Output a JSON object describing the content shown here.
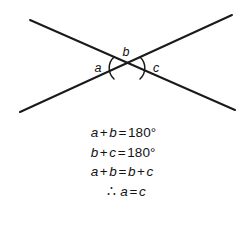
{
  "figure": {
    "line_color": "#1a1a1a",
    "background_color": "#ffffff",
    "labels": {
      "left_angle": "a",
      "top_angle": "b",
      "right_angle": "c"
    },
    "lines": [
      {
        "name": "line-down-right",
        "x1": 30,
        "y1": 20,
        "x2": 235,
        "y2": 110
      },
      {
        "name": "line-up-right",
        "x1": 20,
        "y1": 112,
        "x2": 232,
        "y2": 15
      }
    ],
    "intersection": {
      "x": 127,
      "y": 68
    },
    "arcs": [
      {
        "name": "left-angle-arc",
        "side": "left"
      },
      {
        "name": "right-angle-arc",
        "side": "right"
      }
    ]
  },
  "equations": [
    {
      "id": "eq-1",
      "text": "a + b = 180°",
      "parts": [
        {
          "type": "var",
          "text": "a"
        },
        {
          "type": "op",
          "text": "+"
        },
        {
          "type": "var",
          "text": "b"
        },
        {
          "type": "op",
          "text": "="
        },
        {
          "type": "num",
          "text": "180°"
        }
      ]
    },
    {
      "id": "eq-2",
      "text": "b + c = 180°",
      "parts": [
        {
          "type": "var",
          "text": "b"
        },
        {
          "type": "op",
          "text": "+"
        },
        {
          "type": "var",
          "text": "c"
        },
        {
          "type": "op",
          "text": "="
        },
        {
          "type": "num",
          "text": "180°"
        }
      ]
    },
    {
      "id": "eq-3",
      "text": "a + b = b + c",
      "parts": [
        {
          "type": "var",
          "text": "a"
        },
        {
          "type": "op",
          "text": "+"
        },
        {
          "type": "var",
          "text": "b"
        },
        {
          "type": "op",
          "text": "="
        },
        {
          "type": "var",
          "text": "b"
        },
        {
          "type": "op",
          "text": "+"
        },
        {
          "type": "var",
          "text": "c"
        }
      ]
    },
    {
      "id": "eq-4",
      "text": "∴ a = c",
      "indented": true,
      "parts": [
        {
          "type": "therefore",
          "text": "∴"
        },
        {
          "type": "var",
          "text": "a"
        },
        {
          "type": "op",
          "text": "="
        },
        {
          "type": "var",
          "text": "c"
        }
      ]
    }
  ]
}
